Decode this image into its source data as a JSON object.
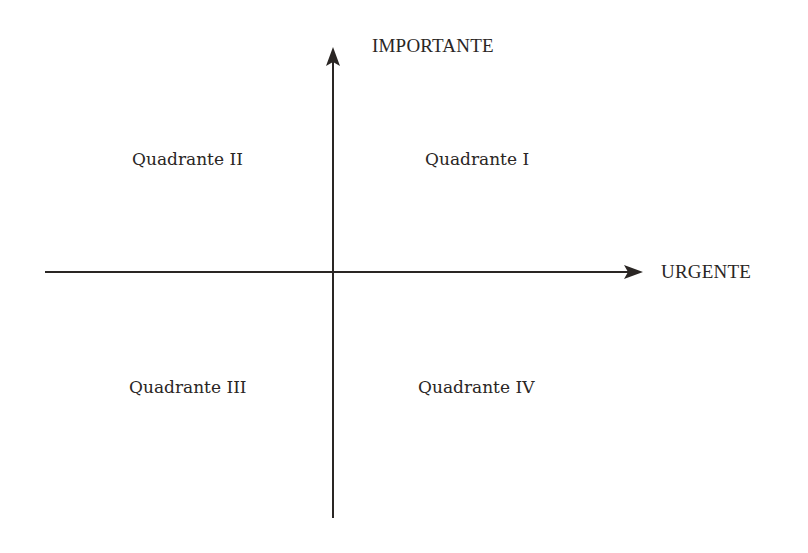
{
  "diagram": {
    "type": "quadrant-matrix",
    "axes": {
      "vertical": {
        "label": "IMPORTANTE",
        "direction": "up"
      },
      "horizontal": {
        "label": "URGENTE",
        "direction": "right"
      }
    },
    "quadrants": [
      {
        "id": "I",
        "label": "Quadrante I",
        "position": "top-right"
      },
      {
        "id": "II",
        "label": "Quadrante II",
        "position": "top-left"
      },
      {
        "id": "III",
        "label": "Quadrante III",
        "position": "bottom-left"
      },
      {
        "id": "IV",
        "label": "Quadrante IV",
        "position": "bottom-right"
      }
    ],
    "colors": {
      "line": "#2a2624",
      "text": "#2a2624",
      "background": "#ffffff"
    }
  }
}
